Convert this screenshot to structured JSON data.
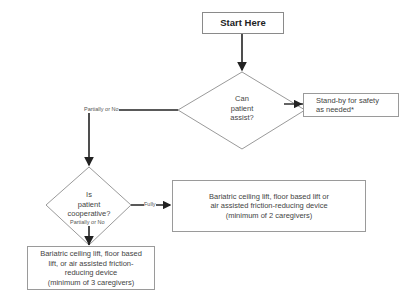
{
  "flowchart": {
    "start": {
      "label": "Start Here"
    },
    "decision_assist": {
      "label": "Can\npatient\nassist?"
    },
    "decision_cooperative": {
      "label": "Is\npatient\ncooperative?"
    },
    "outcome_standby": {
      "label": "Stand-by for safety\nas needed*"
    },
    "outcome_two_caregivers": {
      "label": "Bariatric ceiling lift, floor based lift or\nair assisted friction-reducing device\n(minimum of 2 caregivers)"
    },
    "outcome_three_caregivers": {
      "label": "Bariatric ceiling lift, floor based\nlift, or air assisted friction-\nreducing device\n(minimum of 3 caregivers)"
    },
    "edges": {
      "assist_fully": "Fully",
      "assist_partial": "Partially or No",
      "coop_fully": "Fully",
      "coop_partial": "Partially or No"
    }
  },
  "colors": {
    "line": "#222222",
    "border": "#9a9a9a",
    "text": "#444444"
  }
}
